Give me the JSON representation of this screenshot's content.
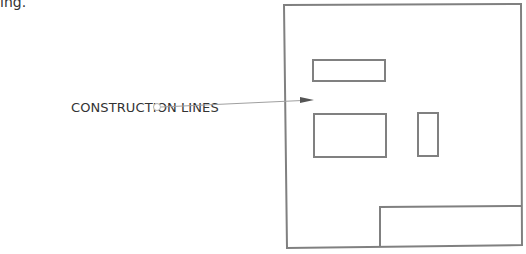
{
  "page": {
    "top_fragment": "ing."
  },
  "diagram": {
    "callout": {
      "label": "CONSTRUCTION LINES",
      "marker": "circle",
      "arrow_target": "construction-line-area"
    },
    "colors": {
      "stroke": "#808080",
      "leader": "#a0a0a0",
      "text": "#333333",
      "arrow": "#555555"
    },
    "shapes": [
      {
        "name": "outer-frame",
        "type": "quad",
        "points": [
          [
            284,
            5
          ],
          [
            521,
            4
          ],
          [
            522,
            245
          ],
          [
            287,
            248
          ]
        ]
      },
      {
        "name": "top-rect",
        "type": "rect",
        "x": 313,
        "y": 60,
        "w": 72,
        "h": 21
      },
      {
        "name": "middle-left-rect",
        "type": "rect",
        "x": 314,
        "y": 114,
        "w": 72,
        "h": 43
      },
      {
        "name": "narrow-rect",
        "type": "rect",
        "x": 418,
        "y": 113,
        "w": 20,
        "h": 43
      },
      {
        "name": "bottom-right-rect",
        "type": "rect",
        "x": 380,
        "y": 207,
        "w": 141,
        "h": 39
      }
    ]
  }
}
